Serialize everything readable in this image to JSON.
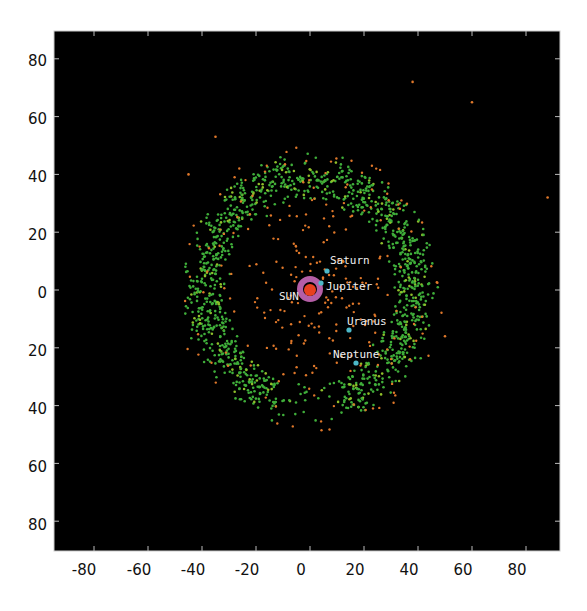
{
  "chart_data": {
    "type": "scatter",
    "title": "",
    "xlabel": "",
    "ylabel": "",
    "xlim": [
      -90,
      90
    ],
    "ylim": [
      -90,
      90
    ],
    "grid": false,
    "legend": null,
    "background": "#000000",
    "x_ticks": [
      -80,
      -60,
      -40,
      -20,
      0,
      20,
      40,
      60,
      80
    ],
    "x_tick_labels": [
      "-80",
      "-60",
      "-40",
      "-20",
      "0",
      "20",
      "40",
      "60",
      "80"
    ],
    "y_ticks": [
      80,
      60,
      40,
      20,
      0,
      -20,
      -40,
      -60,
      -80
    ],
    "y_tick_labels": [
      "80",
      "60",
      "40",
      "20",
      "0",
      "20",
      "40",
      "60",
      "80"
    ],
    "colors": {
      "kuiper_belt": "#3fae3a",
      "scattered_objects": "#e0782a",
      "asteroid_belt": "#c868b8",
      "sun": "#e8401e",
      "planets": "#4cb8c8",
      "label_text": "#f0f0f0"
    },
    "series": [
      {
        "name": "Sun",
        "color": "#e8401e",
        "points": [
          [
            0,
            0
          ]
        ]
      },
      {
        "name": "Planets",
        "color": "#4cb8c8",
        "points": [
          [
            5,
            7
          ],
          [
            3.5,
            2
          ],
          [
            13,
            -13
          ],
          [
            16,
            -25
          ]
        ]
      }
    ],
    "regions": [
      {
        "name": "Kuiper belt (green)",
        "shape": "ring",
        "inner_radius": 30,
        "outer_radius": 48,
        "density": "high",
        "gap": "lower-center (x -10..15, y -25..-50)"
      },
      {
        "name": "Scattered objects (orange)",
        "shape": "sparse",
        "radius_range": [
          5,
          75
        ]
      },
      {
        "name": "Main asteroid belt (pink)",
        "shape": "ring",
        "inner_radius": 2.5,
        "outer_radius": 5
      }
    ],
    "annotations": [
      {
        "text": "SUN",
        "x": -8,
        "y": -2
      },
      {
        "text": "Jupiter",
        "x": 5,
        "y": 2
      },
      {
        "text": "Saturn",
        "x": 6,
        "y": 10
      },
      {
        "text": "Uranus",
        "x": 13,
        "y": -10
      },
      {
        "text": "Neptune",
        "x": 7,
        "y": -21
      }
    ]
  },
  "labels": {
    "sun": "SUN",
    "jupiter": "Jupiter",
    "saturn": "Saturn",
    "uranus": "Uranus",
    "neptune": "Neptune"
  },
  "axes": {
    "x": [
      "-80",
      "-60",
      "-40",
      "-20",
      "0",
      "20",
      "40",
      "60",
      "80"
    ],
    "y": [
      "80",
      "60",
      "40",
      "20",
      "0",
      "20",
      "40",
      "60",
      "80"
    ]
  }
}
